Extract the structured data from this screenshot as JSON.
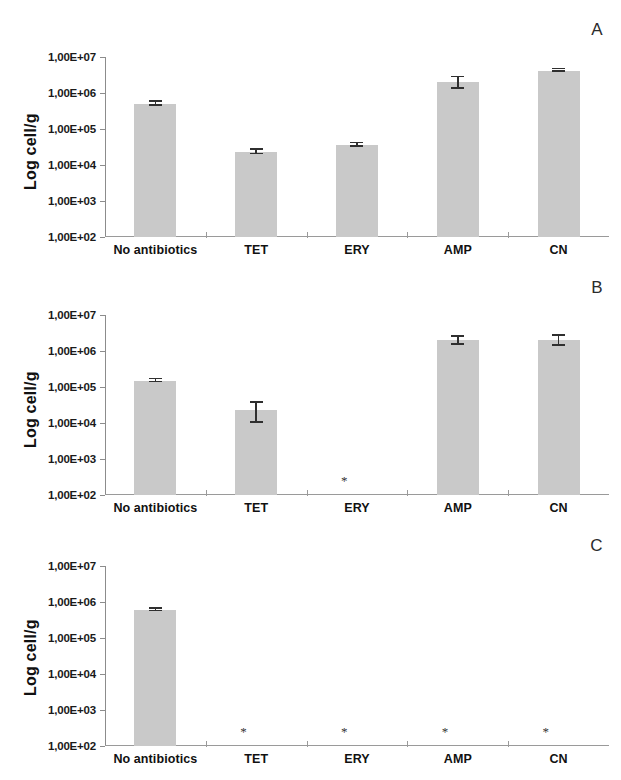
{
  "figure": {
    "ylabel": "Log cell/g",
    "ytick_labels": [
      "1,00E+07",
      "1,00E+06",
      "1,00E+05",
      "1,00E+04",
      "1,00E+03",
      "1,00E+02"
    ],
    "categories": [
      "No antibiotics",
      "TET",
      "ERY",
      "AMP",
      "CN"
    ],
    "bar_color": "#c9c9c9",
    "error_color": "#2f2f2f",
    "axis_color": "#8c8c8c",
    "significance_marker": "*"
  },
  "panels": [
    {
      "letter": "A",
      "id": "panel-A"
    },
    {
      "letter": "B",
      "id": "panel-B"
    },
    {
      "letter": "C",
      "id": "panel-C"
    }
  ],
  "chart_data": [
    {
      "type": "bar",
      "title": "A",
      "xlabel": "",
      "ylabel": "Log cell/g",
      "yscale": "log",
      "ylim": [
        100,
        10000000
      ],
      "ytick_labels": [
        "1,00E+02",
        "1,00E+03",
        "1,00E+04",
        "1,00E+05",
        "1,00E+06",
        "1,00E+07"
      ],
      "categories": [
        "No antibiotics",
        "TET",
        "ERY",
        "AMP",
        "CN"
      ],
      "values": [
        500000.0,
        23000.0,
        36000.0,
        2000000.0,
        4200000.0
      ],
      "errors": [
        60000.0,
        3000.0,
        4000.0,
        700000.0,
        300000.0
      ],
      "markers": [
        null,
        null,
        null,
        null,
        null
      ],
      "grid": false,
      "legend": "none"
    },
    {
      "type": "bar",
      "title": "B",
      "xlabel": "",
      "ylabel": "Log cell/g",
      "yscale": "log",
      "ylim": [
        100,
        10000000
      ],
      "ytick_labels": [
        "1,00E+02",
        "1,00E+03",
        "1,00E+04",
        "1,00E+05",
        "1,00E+06",
        "1,00E+07"
      ],
      "categories": [
        "No antibiotics",
        "TET",
        "ERY",
        "AMP",
        "CN"
      ],
      "values": [
        150000.0,
        23000.0,
        null,
        2000000.0,
        2000000.0
      ],
      "errors": [
        15000.0,
        13000.0,
        null,
        500000.0,
        600000.0
      ],
      "markers": [
        null,
        null,
        "*",
        null,
        null
      ],
      "grid": false,
      "legend": "none"
    },
    {
      "type": "bar",
      "title": "C",
      "xlabel": "",
      "ylabel": "Log cell/g",
      "yscale": "log",
      "ylim": [
        100,
        10000000
      ],
      "ytick_labels": [
        "1,00E+02",
        "1,00E+03",
        "1,00E+04",
        "1,00E+05",
        "1,00E+06",
        "1,00E+07"
      ],
      "categories": [
        "No antibiotics",
        "TET",
        "ERY",
        "AMP",
        "CN"
      ],
      "values": [
        600000.0,
        null,
        null,
        null,
        null
      ],
      "errors": [
        50000.0,
        null,
        null,
        null,
        null
      ],
      "markers": [
        null,
        "*",
        "*",
        "*",
        "*"
      ],
      "grid": false,
      "legend": "none"
    }
  ],
  "caption": {
    "text": ""
  }
}
